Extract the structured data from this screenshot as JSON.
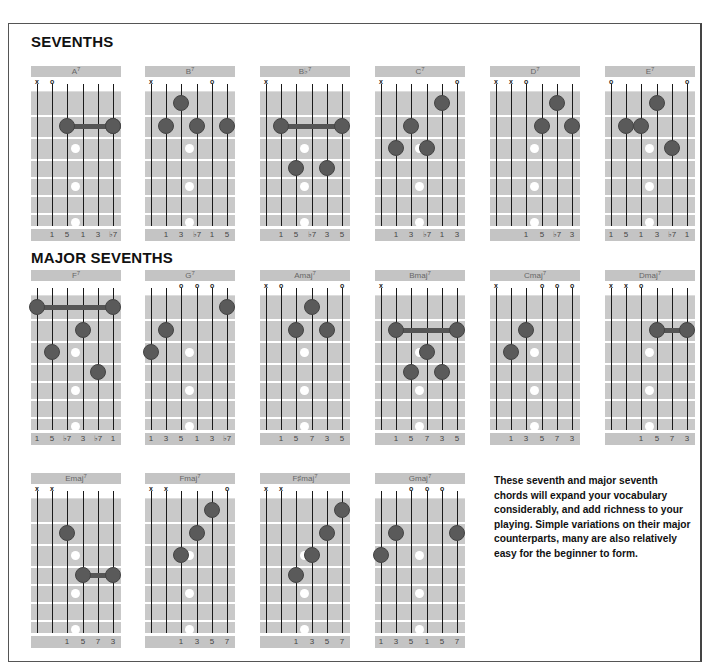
{
  "sections": {
    "sevenths_title": "SEVENTHS",
    "major_sevenths_title": "MAJOR SEVENTHS"
  },
  "blurb": "These seventh and major seventh chords will expand your vocabulary considerably, and add richness to your playing. Simple variations on their major counterparts, many are also relatively easy for the beginner to form.",
  "colors": {
    "fretboard": "#c9c9c9",
    "title_bar": "#c4c4c4",
    "finger_dot": "#5a5a5a",
    "inlay": "#ffffff"
  },
  "chords": [
    {
      "row": 0,
      "col": 0,
      "root": "A",
      "sup": "7",
      "open": [
        null,
        "o",
        null,
        null,
        null,
        null
      ],
      "muted": [
        "x",
        null,
        null,
        null,
        null,
        null
      ],
      "fingers": [
        [
          2,
          5,
          3
        ]
      ],
      "barres": [
        [
          2,
          2,
          5
        ]
      ],
      "degrees": [
        "",
        "1",
        "5",
        "1",
        "3",
        "♭7"
      ]
    },
    {
      "row": 0,
      "col": 1,
      "root": "B",
      "sup": "7",
      "open": [
        null,
        null,
        null,
        null,
        "o",
        null
      ],
      "muted": [
        "x",
        null,
        null,
        null,
        null,
        null
      ],
      "fingers": [
        [
          1,
          2
        ],
        [
          2,
          1
        ],
        [
          2,
          3
        ],
        [
          2,
          5
        ]
      ],
      "barres": [],
      "degrees": [
        "",
        "1",
        "3",
        "♭7",
        "1",
        "5"
      ]
    },
    {
      "row": 0,
      "col": 2,
      "root": "B♭",
      "sup": "7",
      "open": [
        null,
        null,
        null,
        null,
        null,
        null
      ],
      "muted": [
        "x",
        null,
        null,
        null,
        null,
        null
      ],
      "fingers": [
        [
          4,
          2
        ],
        [
          4,
          4
        ]
      ],
      "barres": [
        [
          2,
          1,
          5
        ]
      ],
      "degrees": [
        "",
        "1",
        "5",
        "♭7",
        "3",
        "5"
      ]
    },
    {
      "row": 0,
      "col": 3,
      "root": "C",
      "sup": "7",
      "open": [
        null,
        null,
        null,
        null,
        null,
        "o"
      ],
      "muted": [
        "x",
        null,
        null,
        null,
        null,
        null
      ],
      "fingers": [
        [
          1,
          4
        ],
        [
          2,
          2
        ],
        [
          3,
          1
        ],
        [
          3,
          3
        ]
      ],
      "barres": [],
      "degrees": [
        "",
        "1",
        "3",
        "♭7",
        "1",
        "3"
      ]
    },
    {
      "row": 0,
      "col": 4,
      "root": "D",
      "sup": "7",
      "open": [
        null,
        null,
        "o",
        null,
        null,
        null
      ],
      "muted": [
        "x",
        "x",
        null,
        null,
        null,
        null
      ],
      "fingers": [
        [
          1,
          4
        ],
        [
          2,
          3
        ],
        [
          2,
          5
        ]
      ],
      "barres": [],
      "degrees": [
        "",
        "",
        "1",
        "5",
        "♭7",
        "3"
      ]
    },
    {
      "row": 0,
      "col": 5,
      "root": "E",
      "sup": "7",
      "open": [
        "o",
        null,
        null,
        null,
        null,
        "o"
      ],
      "muted": [
        null,
        null,
        null,
        null,
        null,
        null
      ],
      "fingers": [
        [
          1,
          3
        ],
        [
          2,
          1
        ],
        [
          2,
          2
        ],
        [
          3,
          4
        ]
      ],
      "barres": [],
      "degrees": [
        "1",
        "5",
        "1",
        "3",
        "♭7",
        "1"
      ]
    },
    {
      "row": 1,
      "col": 0,
      "root": "F",
      "sup": "7",
      "open": [
        null,
        null,
        null,
        null,
        null,
        null
      ],
      "muted": [
        null,
        null,
        null,
        null,
        null,
        null
      ],
      "fingers": [
        [
          2,
          3
        ],
        [
          3,
          1
        ],
        [
          4,
          4
        ]
      ],
      "barres": [
        [
          1,
          0,
          5
        ]
      ],
      "degrees": [
        "1",
        "5",
        "♭7",
        "3",
        "♭7",
        "1"
      ]
    },
    {
      "row": 1,
      "col": 1,
      "root": "G",
      "sup": "7",
      "open": [
        null,
        null,
        "o",
        "o",
        "o",
        null
      ],
      "muted": [
        null,
        null,
        null,
        null,
        null,
        null
      ],
      "fingers": [
        [
          1,
          5
        ],
        [
          2,
          1
        ],
        [
          3,
          0
        ]
      ],
      "barres": [],
      "degrees": [
        "1",
        "3",
        "5",
        "1",
        "3",
        "♭7"
      ]
    },
    {
      "row": 1,
      "col": 2,
      "root": "Amaj",
      "sup": "7",
      "open": [
        null,
        "o",
        null,
        null,
        null,
        "o"
      ],
      "muted": [
        "x",
        null,
        null,
        null,
        null,
        null
      ],
      "fingers": [
        [
          1,
          3
        ],
        [
          2,
          2
        ],
        [
          2,
          4
        ]
      ],
      "barres": [],
      "degrees": [
        "",
        "1",
        "5",
        "7",
        "3",
        "5"
      ]
    },
    {
      "row": 1,
      "col": 3,
      "root": "Bmaj",
      "sup": "7",
      "open": [
        null,
        null,
        null,
        null,
        null,
        null
      ],
      "muted": [
        "x",
        null,
        null,
        null,
        null,
        null
      ],
      "fingers": [
        [
          3,
          3
        ],
        [
          4,
          2
        ],
        [
          4,
          4
        ]
      ],
      "barres": [
        [
          2,
          1,
          5
        ]
      ],
      "degrees": [
        "",
        "1",
        "5",
        "7",
        "3",
        "5"
      ]
    },
    {
      "row": 1,
      "col": 4,
      "root": "Cmaj",
      "sup": "7",
      "open": [
        null,
        null,
        null,
        "o",
        "o",
        "o"
      ],
      "muted": [
        "x",
        null,
        null,
        null,
        null,
        null
      ],
      "fingers": [
        [
          2,
          2
        ],
        [
          3,
          1
        ]
      ],
      "barres": [],
      "degrees": [
        "",
        "1",
        "3",
        "5",
        "7",
        "3"
      ]
    },
    {
      "row": 1,
      "col": 5,
      "root": "Dmaj",
      "sup": "7",
      "open": [
        null,
        null,
        "o",
        null,
        null,
        null
      ],
      "muted": [
        "x",
        "x",
        null,
        null,
        null,
        null
      ],
      "fingers": [],
      "barres": [
        [
          2,
          3,
          5
        ]
      ],
      "degrees": [
        "",
        "",
        "1",
        "5",
        "7",
        "3"
      ]
    },
    {
      "row": 2,
      "col": 0,
      "root": "Emaj",
      "sup": "7",
      "open": [
        null,
        null,
        null,
        null,
        null,
        null
      ],
      "muted": [
        "x",
        "x",
        null,
        null,
        null,
        null
      ],
      "fingers": [
        [
          2,
          2
        ]
      ],
      "barres": [
        [
          4,
          3,
          5
        ]
      ],
      "degrees": [
        "",
        "",
        "1",
        "5",
        "7",
        "3"
      ]
    },
    {
      "row": 2,
      "col": 1,
      "root": "Fmaj",
      "sup": "7",
      "open": [
        null,
        null,
        null,
        null,
        null,
        "o"
      ],
      "muted": [
        "x",
        "x",
        null,
        null,
        null,
        null
      ],
      "fingers": [
        [
          1,
          4
        ],
        [
          2,
          3
        ],
        [
          3,
          2
        ]
      ],
      "barres": [],
      "degrees": [
        "",
        "",
        "1",
        "3",
        "5",
        "7"
      ]
    },
    {
      "row": 2,
      "col": 2,
      "root": "F♯maj",
      "sup": "7",
      "open": [
        null,
        null,
        null,
        null,
        null,
        null
      ],
      "muted": [
        "x",
        "x",
        null,
        null,
        null,
        null
      ],
      "fingers": [
        [
          1,
          5
        ],
        [
          2,
          4
        ],
        [
          3,
          3
        ],
        [
          4,
          2
        ]
      ],
      "barres": [],
      "degrees": [
        "",
        "",
        "1",
        "3",
        "5",
        "7"
      ]
    },
    {
      "row": 2,
      "col": 3,
      "root": "Gmaj",
      "sup": "7",
      "open": [
        null,
        null,
        "o",
        "o",
        "o",
        null
      ],
      "muted": [
        null,
        null,
        null,
        null,
        null,
        null
      ],
      "fingers": [
        [
          2,
          1
        ],
        [
          2,
          5
        ],
        [
          3,
          0
        ]
      ],
      "barres": [],
      "degrees": [
        "1",
        "3",
        "5",
        "1",
        "5",
        "7"
      ]
    }
  ]
}
